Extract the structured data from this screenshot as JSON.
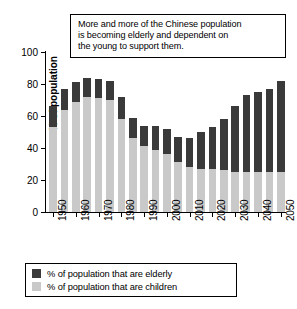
{
  "callout": {
    "name": "annotation-callout",
    "lines": [
      "More and more of the Chinese population",
      "is becoming elderly and dependent on",
      "the young to support them."
    ]
  },
  "legend": {
    "items": [
      {
        "label": "% of population that are elderly",
        "color": "#3a3a3a",
        "key": "elderly"
      },
      {
        "label": "% of population that are children",
        "color": "#c9c9c9",
        "key": "children"
      }
    ]
  },
  "chart_data": {
    "type": "bar",
    "stacked": true,
    "title": "More and more of the Chinese population is becoming elderly and dependent on the young to support them.",
    "xlabel": "",
    "ylabel": "% of population",
    "ylim": [
      0,
      100
    ],
    "yticks": [
      0,
      20,
      40,
      60,
      80,
      100
    ],
    "ytick_labels": [
      "0",
      "20",
      "40",
      "60",
      "80",
      "100"
    ],
    "grid": false,
    "legend_position": "bottom",
    "categories": [
      "1950",
      "1955",
      "1960",
      "1965",
      "1970",
      "1975",
      "1980",
      "1985",
      "1990",
      "1995",
      "2000",
      "2005",
      "2010",
      "2015",
      "2020",
      "2025",
      "2030",
      "2035",
      "2040",
      "2045",
      "2050"
    ],
    "xtick_labels": [
      "1950",
      "1960",
      "1970",
      "1980",
      "1990",
      "2000",
      "2010",
      "2020",
      "2030",
      "2040",
      "2050"
    ],
    "xtick_categories": [
      "1950",
      "1960",
      "1970",
      "1980",
      "1990",
      "2000",
      "2010",
      "2020",
      "2030",
      "2040",
      "2050"
    ],
    "series": [
      {
        "name": "% of population that are children",
        "color": "#c9c9c9",
        "values": [
          53,
          64,
          69,
          72,
          71,
          70,
          58,
          46,
          41,
          39,
          36,
          31,
          28,
          27,
          27,
          26,
          25,
          25,
          25,
          25,
          25
        ]
      },
      {
        "name": "% of population that are elderly",
        "color": "#3a3a3a",
        "values": [
          13,
          13,
          12,
          12,
          12,
          12,
          14,
          13,
          13,
          15,
          16,
          16,
          18,
          23,
          26,
          32,
          41,
          48,
          50,
          52,
          57
        ]
      }
    ],
    "totals": [
      66,
      77,
      81,
      84,
      83,
      82,
      72,
      59,
      54,
      54,
      52,
      47,
      46,
      50,
      53,
      58,
      66,
      73,
      75,
      77,
      82
    ]
  }
}
